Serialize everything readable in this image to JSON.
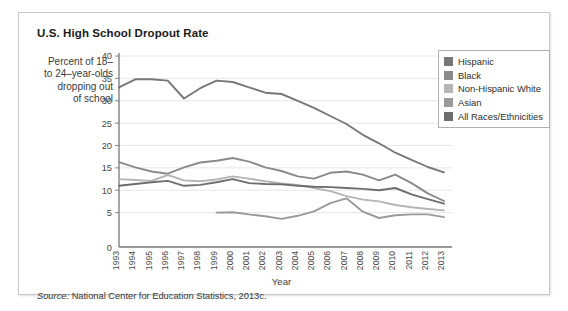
{
  "card": {
    "title": "U.S. High School Dropout Rate",
    "axis_caption": "Percent of 18– to 24–year-olds dropping out of school",
    "axis_caption_lines": [
      "Percent of 18–",
      "to 24–year-olds",
      "dropping out",
      "of school"
    ],
    "source_prefix": "Source:",
    "source_text": "National Center for Education Statistics, 2013c."
  },
  "legend": {
    "position": "top-right",
    "items": [
      {
        "label": "Hispanic",
        "color": "#777777"
      },
      {
        "label": "Black",
        "color": "#8a8a8a"
      },
      {
        "label": "Non-Hispanic White",
        "color": "#b5b5b5"
      },
      {
        "label": "Asian",
        "color": "#9a9a9a"
      },
      {
        "label": "All Races/Ethnicities",
        "color": "#6e6e6e"
      }
    ]
  },
  "chart_data": {
    "type": "line",
    "title": "U.S. High School Dropout Rate",
    "xlabel": "Year",
    "ylabel": "Percent of 18– to 24–year-olds dropping out of school",
    "ylim": [
      0,
      40
    ],
    "yticks": [
      5,
      10,
      15,
      20,
      25,
      30,
      35,
      40
    ],
    "zero_tick": "0",
    "grid": true,
    "x": [
      1993,
      1994,
      1995,
      1996,
      1997,
      1998,
      1999,
      2000,
      2001,
      2002,
      2003,
      2004,
      2005,
      2006,
      2007,
      2008,
      2009,
      2010,
      2011,
      2012,
      2013
    ],
    "categories": [
      "1993",
      "1994",
      "1995",
      "1996",
      "1997",
      "1998",
      "1999",
      "2000",
      "2001",
      "2002",
      "2003",
      "2004",
      "2005",
      "2006",
      "2007",
      "2008",
      "2009",
      "2010",
      "2011",
      "2012",
      "2013"
    ],
    "series": [
      {
        "name": "Hispanic",
        "color": "#777777",
        "values": [
          33.0,
          34.8,
          34.8,
          34.5,
          30.5,
          32.8,
          34.5,
          34.2,
          33.0,
          31.8,
          31.5,
          30.0,
          28.4,
          26.6,
          24.8,
          22.4,
          20.5,
          18.4,
          16.8,
          15.2,
          14.0
        ]
      },
      {
        "name": "Black",
        "color": "#8a8a8a",
        "values": [
          16.3,
          15.1,
          14.2,
          13.7,
          15.1,
          16.2,
          16.6,
          17.2,
          16.4,
          15.1,
          14.3,
          13.1,
          12.6,
          13.9,
          14.2,
          13.5,
          12.2,
          13.5,
          11.6,
          9.3,
          7.6
        ]
      },
      {
        "name": "Non-Hispanic White",
        "color": "#b5b5b5",
        "values": [
          12.5,
          12.3,
          12.1,
          13.4,
          12.2,
          12.0,
          12.4,
          13.1,
          12.6,
          12.0,
          11.5,
          11.2,
          10.5,
          9.8,
          8.7,
          7.9,
          7.5,
          6.7,
          6.2,
          5.8,
          5.5
        ]
      },
      {
        "name": "Asian",
        "color": "#9a9a9a",
        "values": [
          null,
          null,
          null,
          null,
          null,
          null,
          5.0,
          5.1,
          4.6,
          4.2,
          3.6,
          4.3,
          5.3,
          7.1,
          8.2,
          5.2,
          3.8,
          4.4,
          4.6,
          4.6,
          4.0
        ]
      },
      {
        "name": "All Races/Ethnicities",
        "color": "#6e6e6e",
        "values": [
          11.0,
          11.4,
          11.8,
          12.1,
          11.0,
          11.2,
          11.8,
          12.5,
          11.6,
          11.4,
          11.3,
          11.0,
          10.8,
          10.7,
          10.5,
          10.3,
          10.0,
          10.5,
          9.1,
          8.0,
          7.0
        ]
      }
    ]
  }
}
